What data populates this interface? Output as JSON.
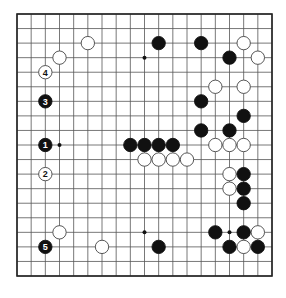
{
  "diagram": {
    "type": "go-board",
    "size": 19,
    "colors": {
      "line": "#555555",
      "border": "#222222",
      "black": "#111111",
      "white": "#ffffff",
      "background": "#ffffff"
    },
    "star_points_visible": [
      [
        3,
        9
      ],
      [
        9,
        3
      ],
      [
        9,
        15
      ],
      [
        15,
        15
      ]
    ],
    "stones": [
      {
        "color": "black",
        "col": 10,
        "row": 2
      },
      {
        "color": "black",
        "col": 13,
        "row": 2
      },
      {
        "color": "white",
        "col": 16,
        "row": 2
      },
      {
        "color": "white",
        "col": 5,
        "row": 2
      },
      {
        "color": "white",
        "col": 3,
        "row": 3
      },
      {
        "color": "black",
        "col": 15,
        "row": 3
      },
      {
        "color": "white",
        "col": 17,
        "row": 3
      },
      {
        "color": "white",
        "col": 2,
        "row": 4,
        "label": "4"
      },
      {
        "color": "white",
        "col": 14,
        "row": 5
      },
      {
        "color": "white",
        "col": 16,
        "row": 5
      },
      {
        "color": "black",
        "col": 2,
        "row": 6,
        "label": "3"
      },
      {
        "color": "black",
        "col": 13,
        "row": 6
      },
      {
        "color": "black",
        "col": 16,
        "row": 7
      },
      {
        "color": "black",
        "col": 13,
        "row": 8
      },
      {
        "color": "black",
        "col": 15,
        "row": 8
      },
      {
        "color": "black",
        "col": 2,
        "row": 9,
        "label": "1"
      },
      {
        "color": "black",
        "col": 8,
        "row": 9
      },
      {
        "color": "black",
        "col": 9,
        "row": 9
      },
      {
        "color": "black",
        "col": 10,
        "row": 9
      },
      {
        "color": "black",
        "col": 11,
        "row": 9
      },
      {
        "color": "white",
        "col": 14,
        "row": 9
      },
      {
        "color": "white",
        "col": 15,
        "row": 9
      },
      {
        "color": "white",
        "col": 16,
        "row": 9
      },
      {
        "color": "white",
        "col": 9,
        "row": 10
      },
      {
        "color": "white",
        "col": 10,
        "row": 10
      },
      {
        "color": "white",
        "col": 11,
        "row": 10
      },
      {
        "color": "white",
        "col": 12,
        "row": 10
      },
      {
        "color": "white",
        "col": 2,
        "row": 11,
        "label": "2"
      },
      {
        "color": "white",
        "col": 15,
        "row": 11
      },
      {
        "color": "black",
        "col": 16,
        "row": 11
      },
      {
        "color": "white",
        "col": 15,
        "row": 12
      },
      {
        "color": "black",
        "col": 16,
        "row": 12
      },
      {
        "color": "black",
        "col": 16,
        "row": 13
      },
      {
        "color": "white",
        "col": 3,
        "row": 15
      },
      {
        "color": "black",
        "col": 14,
        "row": 15
      },
      {
        "color": "black",
        "col": 16,
        "row": 15
      },
      {
        "color": "white",
        "col": 17,
        "row": 15
      },
      {
        "color": "black",
        "col": 2,
        "row": 16,
        "label": "5"
      },
      {
        "color": "white",
        "col": 6,
        "row": 16
      },
      {
        "color": "black",
        "col": 10,
        "row": 16
      },
      {
        "color": "black",
        "col": 15,
        "row": 16
      },
      {
        "color": "white",
        "col": 16,
        "row": 16
      },
      {
        "color": "black",
        "col": 17,
        "row": 16
      }
    ]
  }
}
